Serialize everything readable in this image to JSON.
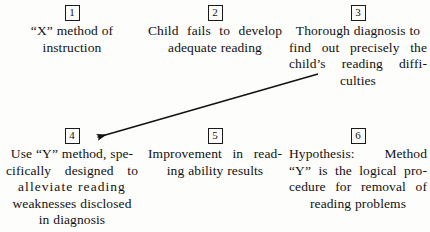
{
  "diagram": {
    "nodes": [
      {
        "number": "1",
        "lines": [
          "“X” method of",
          "instruction"
        ],
        "text": "“X” method of instruction"
      },
      {
        "number": "2",
        "lines": [
          "Child fails to develop",
          "adequate reading"
        ],
        "text": "Child fails to develop adequate reading"
      },
      {
        "number": "3",
        "lines": [
          "Thorough diagnosis to",
          "find out precisely the",
          "child’s reading diffi-",
          "culties"
        ],
        "text": "Thorough diagnosis to find out precisely the child’s reading difficulties"
      },
      {
        "number": "4",
        "lines": [
          "Use “Y” method, spe-",
          "cifically designed to",
          "alleviate reading",
          "weaknesses disclosed",
          "in diagnosis"
        ],
        "text": "Use “Y” method, specifically designed to alleviate reading weaknesses disclosed in diagnosis"
      },
      {
        "number": "5",
        "lines": [
          "Improvement in read-",
          "ing ability results"
        ],
        "text": "Improvement in reading ability results"
      },
      {
        "number": "6",
        "lines": [
          "Hypothesis: Method",
          "“Y” is the logical pro-",
          "cedure for removal of",
          "reading problems"
        ],
        "text": "Hypothesis: Method “Y” is the logical procedure for removal of reading problems"
      }
    ],
    "arrows": [
      {
        "name": "arrow-node3-to-node4",
        "from": "3",
        "to": "4",
        "start_x": 318,
        "start_y": 74,
        "end_x": 91,
        "end_y": 139
      }
    ],
    "colors": {
      "ink": "#111111",
      "background": "#fdfdfb",
      "box_border": "#1a1a1a"
    }
  }
}
